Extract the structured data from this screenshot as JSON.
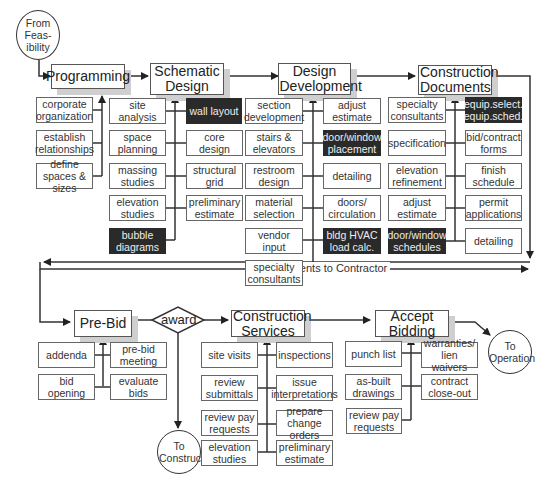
{
  "diagram": {
    "start": {
      "label": "From Feas- ibility"
    },
    "phases": [
      {
        "id": "programming",
        "label": "Programming"
      },
      {
        "id": "schematic",
        "label": "Schematic Design"
      },
      {
        "id": "design_dev",
        "label": "Design Development"
      },
      {
        "id": "construction_docs",
        "label": "Construction Documents"
      },
      {
        "id": "pre_bid",
        "label": "Pre-Bid"
      },
      {
        "id": "construction_services",
        "label": "Construction Services"
      },
      {
        "id": "accept_bidding",
        "label": "Accept Bidding"
      }
    ],
    "decision": {
      "label": "award"
    },
    "connector_label": "Documents to Contractor",
    "end_nodes": {
      "to_construct": "To Construct",
      "to_operation": "To Operation"
    },
    "tasks": {
      "programming": [
        {
          "label": "corporate organization",
          "dark": false
        },
        {
          "label": "establish relationships",
          "dark": false
        },
        {
          "label": "define spaces & sizes",
          "dark": false
        }
      ],
      "schematic_left": [
        {
          "label": "site analysis",
          "dark": false
        },
        {
          "label": "space planning",
          "dark": false
        },
        {
          "label": "massing studies",
          "dark": false
        },
        {
          "label": "elevation studies",
          "dark": false
        },
        {
          "label": "bubble diagrams",
          "dark": true
        }
      ],
      "schematic_right": [
        {
          "label": "wall layout",
          "dark": true
        },
        {
          "label": "core design",
          "dark": false
        },
        {
          "label": "structural grid",
          "dark": false
        },
        {
          "label": "preliminary estimate",
          "dark": false
        }
      ],
      "design_dev_left": [
        {
          "label": "section development",
          "dark": false
        },
        {
          "label": "stairs & elevators",
          "dark": false
        },
        {
          "label": "restroom design",
          "dark": false
        },
        {
          "label": "material selection",
          "dark": false
        },
        {
          "label": "vendor input",
          "dark": false
        },
        {
          "label": "specialty consultants",
          "dark": false
        }
      ],
      "design_dev_right": [
        {
          "label": "adjust estimate",
          "dark": false
        },
        {
          "label": "door/window placement",
          "dark": true
        },
        {
          "label": "detailing",
          "dark": false
        },
        {
          "label": "doors/ circulation",
          "dark": false
        },
        {
          "label": "bldg HVAC load calc.",
          "dark": true
        }
      ],
      "construction_docs_left": [
        {
          "label": "specialty consultants",
          "dark": false
        },
        {
          "label": "specification",
          "dark": false
        },
        {
          "label": "elevation refinement",
          "dark": false
        },
        {
          "label": "adjust estimate",
          "dark": false
        },
        {
          "label": "door/window schedules",
          "dark": true
        }
      ],
      "construction_docs_right": [
        {
          "label": "equip.select. equip.sched.",
          "dark": true
        },
        {
          "label": "bid/contract forms",
          "dark": false
        },
        {
          "label": "finish schedule",
          "dark": false
        },
        {
          "label": "permit applications",
          "dark": false
        },
        {
          "label": "detailing",
          "dark": false
        }
      ],
      "pre_bid_left": [
        {
          "label": "addenda",
          "dark": false
        },
        {
          "label": "bid opening",
          "dark": false
        }
      ],
      "pre_bid_right": [
        {
          "label": "pre-bid meeting",
          "dark": false
        },
        {
          "label": "evaluate bids",
          "dark": false
        }
      ],
      "construction_services_left": [
        {
          "label": "site visits",
          "dark": false
        },
        {
          "label": "review submittals",
          "dark": false
        },
        {
          "label": "review pay requests",
          "dark": false
        },
        {
          "label": "elevation studies",
          "dark": false
        }
      ],
      "construction_services_right": [
        {
          "label": "inspections",
          "dark": false
        },
        {
          "label": "issue interpretations",
          "dark": false
        },
        {
          "label": "prepare change orders",
          "dark": false
        },
        {
          "label": "preliminary estimate",
          "dark": false
        }
      ],
      "accept_bidding_left": [
        {
          "label": "punch list",
          "dark": false
        },
        {
          "label": "as-built drawings",
          "dark": false
        },
        {
          "label": "review pay requests",
          "dark": false
        }
      ],
      "accept_bidding_right": [
        {
          "label": "warranties/ lien waivers",
          "dark": false
        },
        {
          "label": "contract close-out",
          "dark": false
        }
      ]
    },
    "colors": {
      "line": "#333333",
      "dark_box": "#2a2a2a",
      "shadow": "#cfcfcf"
    }
  }
}
